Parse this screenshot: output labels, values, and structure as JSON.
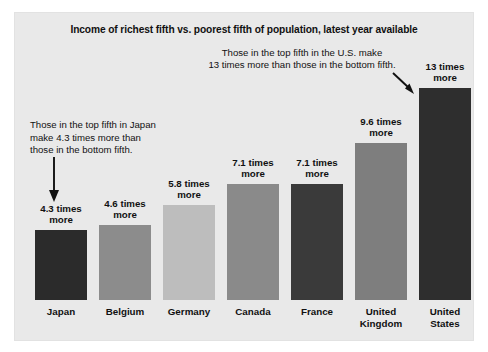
{
  "panel": {
    "background_color": "#e9e9e9",
    "page_background_color": "#ffffff"
  },
  "title": "Income of richest fifth vs. poorest fifth of population, latest year available",
  "annotations": {
    "united_states": {
      "line1": "Those in the top fifth in the U.S. make",
      "line2": "13 times more than those in the bottom fifth.",
      "arrow": "diagonal-down-right-arrow"
    },
    "japan": {
      "line1": "Those in the top fifth in Japan",
      "line2": "make 4.3 times more than",
      "line3": "those in the bottom fifth.",
      "arrow": "down-arrow"
    }
  },
  "chart_data": {
    "type": "bar",
    "title": "Income of richest fifth vs. poorest fifth of population, latest year available",
    "xlabel": "",
    "ylabel": "",
    "ylim": [
      0,
      13
    ],
    "grid": false,
    "legend": "none",
    "categories": [
      "Japan",
      "Belgium",
      "Germany",
      "Canada",
      "France",
      "United Kingdom",
      "United States"
    ],
    "values": [
      4.3,
      4.6,
      5.8,
      7.1,
      7.1,
      9.6,
      13
    ],
    "value_labels": [
      "4.3 times\nmore",
      "4.6 times\nmore",
      "5.8 times\nmore",
      "7.1 times\nmore",
      "7.1 times\nmore",
      "9.6 times\nmore",
      "13 times\nmore"
    ],
    "bar_colors": [
      "#2b2b2b",
      "#8c8c8c",
      "#bdbdbd",
      "#8a8a8a",
      "#3a3a3a",
      "#7e7e7e",
      "#2e2e2e"
    ],
    "bars": [
      {
        "category": "Japan",
        "label_line1": "Japan",
        "label_line2": "",
        "value": 4.3,
        "value_line1": "4.3 times",
        "value_line2": "more",
        "color": "#2b2b2b"
      },
      {
        "category": "Belgium",
        "label_line1": "Belgium",
        "label_line2": "",
        "value": 4.6,
        "value_line1": "4.6 times",
        "value_line2": "more",
        "color": "#8c8c8c"
      },
      {
        "category": "Germany",
        "label_line1": "Germany",
        "label_line2": "",
        "value": 5.8,
        "value_line1": "5.8 times",
        "value_line2": "more",
        "color": "#bdbdbd"
      },
      {
        "category": "Canada",
        "label_line1": "Canada",
        "label_line2": "",
        "value": 7.1,
        "value_line1": "7.1 times",
        "value_line2": "more",
        "color": "#8a8a8a"
      },
      {
        "category": "France",
        "label_line1": "France",
        "label_line2": "",
        "value": 7.1,
        "value_line1": "7.1 times",
        "value_line2": "more",
        "color": "#3a3a3a"
      },
      {
        "category": "United Kingdom",
        "label_line1": "United",
        "label_line2": "Kingdom",
        "value": 9.6,
        "value_line1": "9.6 times",
        "value_line2": "more",
        "color": "#7e7e7e"
      },
      {
        "category": "United States",
        "label_line1": "United",
        "label_line2": "States",
        "value": 13,
        "value_line1": "13 times",
        "value_line2": "more",
        "color": "#2e2e2e"
      }
    ]
  }
}
